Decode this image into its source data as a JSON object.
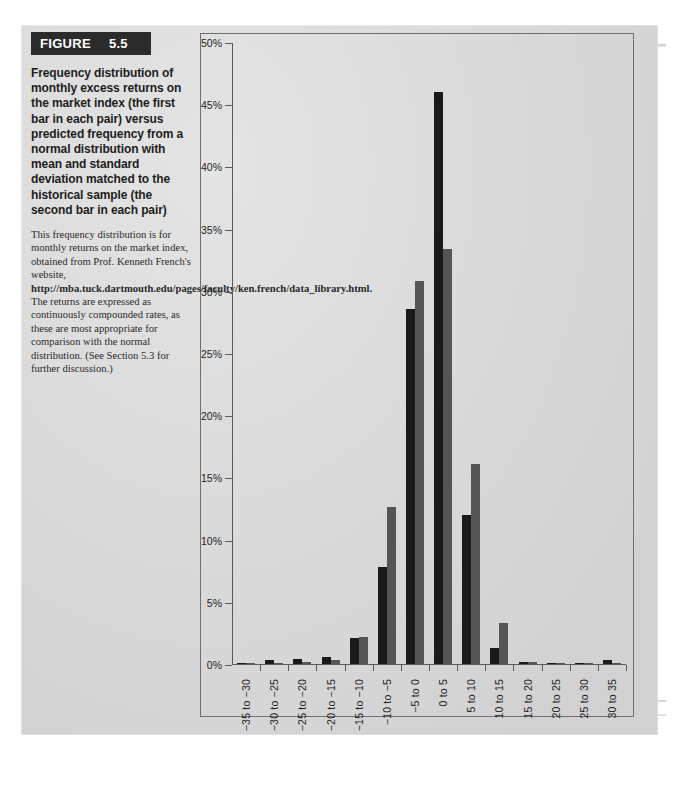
{
  "figure": {
    "tag_word": "FIGURE",
    "tag_number": "5.5",
    "title": "Frequency distribution of monthly excess returns on the market index (the first bar in each pair) versus predicted frequency from a normal distribution with mean and standard deviation matched to the historical sample (the second bar in each pair)",
    "caption_part1": "This frequency distribution is for monthly returns on the market index, obtained from Prof. Kenneth French's website, ",
    "caption_url": "http://mba.tuck.dartmouth.edu/pages/faculty/ken.french/data_library.html.",
    "caption_part2": " The returns are expressed as continuously compounded rates, as these are most appropriate for comparison with the normal distribution. (See Section 5.3 for further discussion.)"
  },
  "chart_data": {
    "type": "bar",
    "title": "",
    "xlabel": "",
    "ylabel": "",
    "ylim": [
      0,
      50
    ],
    "ytick_labels": [
      "0%",
      "5%",
      "10%",
      "15%",
      "20%",
      "25%",
      "30%",
      "35%",
      "40%",
      "45%",
      "50%"
    ],
    "ytick_values": [
      0,
      5,
      10,
      15,
      20,
      25,
      30,
      35,
      40,
      45,
      50
    ],
    "grid": false,
    "legend_position": "none",
    "categories": [
      "−35 to −30",
      "−30 to −25",
      "−25 to −20",
      "−20 to −15",
      "−15 to −10",
      "−10 to −5",
      "−5 to 0",
      "0 to 5",
      "5 to 10",
      "10 to 15",
      "15 to 20",
      "20 to 25",
      "25 to 30",
      "30 to 35"
    ],
    "series": [
      {
        "name": "Historical frequency (market index)",
        "color": "#1a1a1a",
        "values": [
          0.1,
          0.3,
          0.4,
          0.6,
          2.1,
          7.8,
          28.5,
          46.0,
          12.0,
          1.3,
          0.2,
          0.05,
          0.05,
          0.3
        ]
      },
      {
        "name": "Predicted frequency (normal distribution)",
        "color": "#555555",
        "values": [
          0.0,
          0.1,
          0.2,
          0.3,
          2.2,
          12.6,
          30.8,
          33.4,
          16.1,
          3.3,
          0.2,
          0.05,
          0.03,
          0.02
        ]
      }
    ]
  },
  "colors": {
    "panel_background": "#dcdcdc",
    "tag_background": "#2b2b2b",
    "axis": "#5a5a5a",
    "historical_bar": "#1a1a1a",
    "normal_bar": "#555555"
  }
}
